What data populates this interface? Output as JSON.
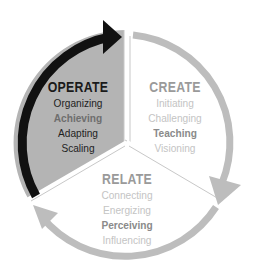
{
  "colors": {
    "operate_fill": "#b4b4b4",
    "operate_arrow": "#111111",
    "cycle_arrow": "#bdbdbd",
    "divider": "#bdbdbd",
    "operate_heading": "#1a1a1a",
    "operate_item": "#1e1e1e",
    "operate_item_muted": "#6e6e6e",
    "light_heading": "#9a9a9a",
    "light_item": "#c4c4c4",
    "light_item_emph": "#8a8a8a"
  },
  "sectors": [
    {
      "id": "operate",
      "heading": "OPERATE",
      "items": [
        {
          "label": "Organizing",
          "tone": "dark"
        },
        {
          "label": "Achieving",
          "tone": "muted"
        },
        {
          "label": "Adapting",
          "tone": "dark"
        },
        {
          "label": "Scaling",
          "tone": "dark"
        }
      ]
    },
    {
      "id": "create",
      "heading": "CREATE",
      "items": [
        {
          "label": "Initiating",
          "tone": "light"
        },
        {
          "label": "Challenging",
          "tone": "light"
        },
        {
          "label": "Teaching",
          "tone": "emph"
        },
        {
          "label": "Visioning",
          "tone": "light"
        }
      ]
    },
    {
      "id": "relate",
      "heading": "RELATE",
      "items": [
        {
          "label": "Connecting",
          "tone": "light"
        },
        {
          "label": "Energizing",
          "tone": "light"
        },
        {
          "label": "Perceiving",
          "tone": "emph"
        },
        {
          "label": "Influencing",
          "tone": "light"
        }
      ]
    }
  ]
}
